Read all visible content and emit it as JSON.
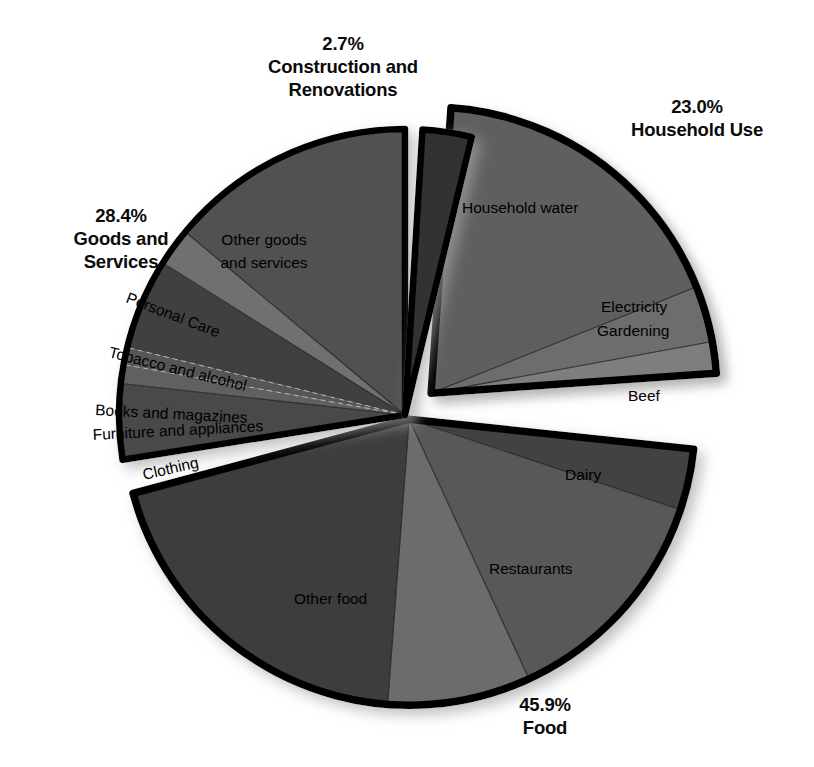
{
  "chart_data": {
    "type": "pie",
    "title": "",
    "subtitle": "",
    "xlabel": "",
    "ylabel": "",
    "legend_position": "none",
    "grid": false,
    "units": "percent",
    "total": 100.0,
    "groups": [
      {
        "name": "Household Use",
        "percent_label": "23.0%",
        "value": 23.0,
        "exploded": true,
        "slices": [
          {
            "label": "Household water",
            "value": 18.0,
            "color": "#5e5e5e"
          },
          {
            "label": "Electricity",
            "value": 3.2,
            "color": "#6d6d6d"
          },
          {
            "label": "Gardening",
            "value": 1.8,
            "color": "#7e7e7e"
          }
        ]
      },
      {
        "name": "Food",
        "percent_label": "45.9%",
        "value": 45.9,
        "exploded": false,
        "slices": [
          {
            "label": "Beef",
            "value": 3.6,
            "color": "#434343"
          },
          {
            "label": "Dairy",
            "value": 13.5,
            "color": "#585858"
          },
          {
            "label": "Restaurants",
            "value": 8.4,
            "color": "#6c6c6c"
          },
          {
            "label": "Other food",
            "value": 20.4,
            "color": "#3d3d3d"
          }
        ]
      },
      {
        "name": "Goods and Services",
        "percent_label": "28.4%",
        "value": 28.4,
        "exploded": false,
        "slices": [
          {
            "label": "Clothing",
            "value": 4.4,
            "color": "#4a4a4a"
          },
          {
            "label": "Furniture and appliances",
            "value": 1.1,
            "color": "#616161"
          },
          {
            "label": "Books and magazines",
            "value": 1.0,
            "color": "#565656"
          },
          {
            "label": "Tobacco and alcohol",
            "value": 5.3,
            "color": "#404040"
          },
          {
            "label": "Personal Care",
            "value": 2.2,
            "color": "#6f6f6f"
          },
          {
            "label": "Other goods and services",
            "value": 14.4,
            "color": "#515151"
          }
        ]
      },
      {
        "name": "Construction and Renovations",
        "percent_label": "2.7%",
        "value": 2.7,
        "exploded": false,
        "slices": [
          {
            "label": "Construction and Renovations",
            "value": 2.7,
            "color": "#303030"
          }
        ]
      }
    ]
  },
  "callouts": [
    {
      "id": "construction",
      "percent": "2.7%",
      "name_line1": "Construction and",
      "name_line2": "Renovations",
      "x": 343,
      "y": 50,
      "anchor": "middle"
    },
    {
      "id": "household",
      "percent": "23.0%",
      "name_line1": "Household Use",
      "name_line2": "",
      "x": 697,
      "y": 113,
      "anchor": "middle"
    },
    {
      "id": "goods",
      "percent": "28.4%",
      "name_line1": "Goods and",
      "name_line2": "Services",
      "x": 121,
      "y": 222,
      "anchor": "middle"
    },
    {
      "id": "food",
      "percent": "45.9%",
      "name_line1": "Food",
      "name_line2": "",
      "x": 545,
      "y": 711,
      "anchor": "middle"
    }
  ],
  "slice_labels": [
    {
      "id": "household-water",
      "text": "Household water",
      "x": 462,
      "y": 213,
      "rotate": 0,
      "anchor": "start"
    },
    {
      "id": "electricity",
      "text": "Electricity",
      "x": 601,
      "y": 312,
      "rotate": 0,
      "anchor": "start"
    },
    {
      "id": "gardening",
      "text": "Gardening",
      "x": 597,
      "y": 336,
      "rotate": 0,
      "anchor": "start"
    },
    {
      "id": "beef",
      "text": "Beef",
      "x": 628,
      "y": 401,
      "rotate": 0,
      "anchor": "start"
    },
    {
      "id": "dairy",
      "text": "Dairy",
      "x": 565,
      "y": 480,
      "rotate": 0,
      "anchor": "start"
    },
    {
      "id": "restaurants",
      "text": "Restaurants",
      "x": 489,
      "y": 574,
      "rotate": 0,
      "anchor": "start"
    },
    {
      "id": "other-food",
      "text": "Other food",
      "x": 294,
      "y": 604,
      "rotate": 0,
      "anchor": "start"
    },
    {
      "id": "other-goods",
      "text": "Other goods",
      "x": 264,
      "y": 245,
      "rotate": 0,
      "anchor": "middle"
    },
    {
      "id": "other-goods-2",
      "text": "and services",
      "x": 264,
      "y": 268,
      "rotate": 0,
      "anchor": "middle"
    },
    {
      "id": "personal-care",
      "text": "Personal Care",
      "x": 125,
      "y": 302,
      "rotate": 21,
      "anchor": "start"
    },
    {
      "id": "tobacco-alcohol",
      "text": "Tobacco and alcohol",
      "x": 108,
      "y": 357,
      "rotate": 14,
      "anchor": "start"
    },
    {
      "id": "books-magazines",
      "text": "Books and magazines",
      "x": 95,
      "y": 415,
      "rotate": 3,
      "anchor": "start"
    },
    {
      "id": "furniture-appliances",
      "text": "Furniture and appliances",
      "x": 93,
      "y": 440,
      "rotate": -3,
      "anchor": "start"
    },
    {
      "id": "clothing",
      "text": "Clothing",
      "x": 144,
      "y": 480,
      "rotate": -13,
      "anchor": "start"
    }
  ],
  "colors": {
    "background": "#ffffff",
    "outline": "#000000",
    "text": "#000000",
    "construction_wedge": "#303030",
    "shadow": "#c9c9c9"
  }
}
